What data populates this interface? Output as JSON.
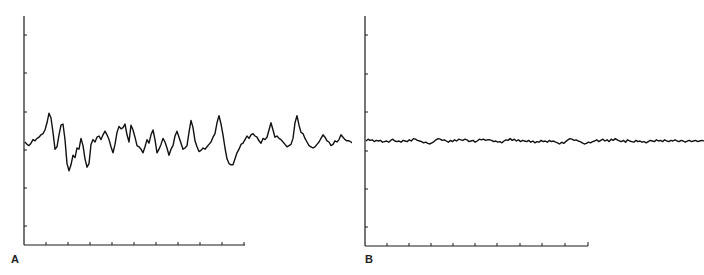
{
  "chart_data": [
    {
      "type": "line",
      "panel_label": "A",
      "title": "",
      "xlabel": "",
      "ylabel": "",
      "grid": false,
      "x_ticks": 10,
      "y_ticks": 6,
      "description": "Large-amplitude irregular fluctuating trace",
      "x": [
        0,
        2,
        4,
        6,
        8,
        10,
        12,
        14,
        16,
        18,
        20,
        22,
        24,
        26,
        28,
        30,
        32,
        34,
        36,
        38,
        40,
        42,
        44,
        46,
        48,
        50,
        52,
        54,
        56,
        58,
        60,
        62,
        64,
        66,
        68,
        70,
        72,
        74,
        76,
        78,
        80,
        82,
        84,
        86,
        88,
        90,
        92,
        94,
        96,
        98,
        100,
        102,
        104,
        106,
        108,
        110,
        112,
        114,
        116,
        118,
        120,
        122,
        124,
        126,
        128,
        130,
        132,
        134,
        136,
        138,
        140,
        142,
        144,
        146,
        148,
        150,
        152,
        154,
        156,
        158,
        160,
        162,
        164,
        166,
        168,
        170,
        172,
        174,
        176,
        178,
        180,
        182,
        184,
        186,
        188,
        190,
        192,
        194,
        196,
        198,
        200,
        202,
        204,
        206,
        208,
        210,
        212,
        214,
        216,
        218,
        220,
        222,
        224,
        226,
        228,
        230,
        232,
        234,
        236,
        238,
        240,
        242,
        244,
        246,
        248,
        250,
        252,
        254,
        256,
        258,
        260,
        262,
        264,
        266,
        268,
        270,
        272,
        274,
        276,
        278,
        280,
        282,
        284,
        286,
        288,
        290,
        292,
        294,
        296,
        298,
        300,
        302,
        304,
        306,
        308,
        310,
        312,
        314,
        316,
        318,
        320,
        322,
        324,
        326,
        328
      ],
      "values": [
        0.0,
        -0.2,
        -0.3,
        -0.1,
        0.2,
        0.1,
        0.3,
        0.4,
        0.6,
        0.7,
        1.0,
        1.6,
        2.4,
        2.0,
        0.8,
        -0.6,
        -0.4,
        0.6,
        1.4,
        1.5,
        0.2,
        -1.8,
        -2.4,
        -1.9,
        -1.1,
        -1.3,
        -0.5,
        -0.6,
        0.3,
        -0.3,
        -1.4,
        -2.1,
        -1.8,
        -0.2,
        0.2,
        0.0,
        0.4,
        0.5,
        0.2,
        0.6,
        0.9,
        0.6,
        0.2,
        -0.4,
        -0.9,
        -0.2,
        0.8,
        1.3,
        1.1,
        1.2,
        1.5,
        0.6,
        0.0,
        1.4,
        1.0,
        0.4,
        -0.3,
        -0.4,
        -0.6,
        -0.9,
        -0.4,
        0.2,
        -0.1,
        0.6,
        1.0,
        0.2,
        -0.9,
        -0.6,
        -0.2,
        0.3,
        0.0,
        -0.5,
        -1.1,
        -0.6,
        -0.3,
        0.5,
        0.9,
        0.4,
        -0.1,
        -0.6,
        -0.5,
        -0.3,
        0.8,
        1.8,
        1.2,
        0.1,
        -0.4,
        -0.8,
        -0.7,
        -0.5,
        -0.6,
        -0.4,
        -0.2,
        0.0,
        0.4,
        0.7,
        1.6,
        2.2,
        1.5,
        0.6,
        -0.5,
        -1.4,
        -1.8,
        -1.9,
        -1.9,
        -1.4,
        -0.9,
        -0.6,
        -0.2,
        -0.1,
        0.2,
        0.5,
        0.3,
        0.6,
        0.7,
        0.5,
        0.4,
        0.1,
        -0.1,
        0.3,
        0.2,
        0.4,
        1.0,
        1.6,
        1.0,
        0.4,
        0.5,
        0.3,
        0.2,
        0.0,
        -0.2,
        -0.4,
        -0.3,
        -0.2,
        0.3,
        1.6,
        2.2,
        1.4,
        0.8,
        0.7,
        0.3,
        0.0,
        -0.3,
        -0.4,
        -0.5,
        -0.4,
        -0.2,
        0.0,
        0.3,
        0.6,
        0.4,
        0.1,
        0.0,
        -0.3,
        -0.2,
        0.1,
        0.0,
        0.2,
        0.6,
        0.4,
        0.2,
        0.1,
        0.1,
        0.0,
        -0.1,
        0.1,
        0.0,
        0.0,
        0.0
      ]
    },
    {
      "type": "line",
      "panel_label": "B",
      "title": "",
      "xlabel": "",
      "ylabel": "",
      "grid": false,
      "x_ticks": 10,
      "y_ticks": 6,
      "description": "Low-amplitude flat noisy trace",
      "x": [
        0,
        2,
        4,
        6,
        8,
        10,
        12,
        14,
        16,
        18,
        20,
        22,
        24,
        26,
        28,
        30,
        32,
        34,
        36,
        38,
        40,
        42,
        44,
        46,
        48,
        50,
        52,
        54,
        56,
        58,
        60,
        62,
        64,
        66,
        68,
        70,
        72,
        74,
        76,
        78,
        80,
        82,
        84,
        86,
        88,
        90,
        92,
        94,
        96,
        98,
        100,
        102,
        104,
        106,
        108,
        110,
        112,
        114,
        116,
        118,
        120,
        122,
        124,
        126,
        128,
        130,
        132,
        134,
        136,
        138,
        140,
        142,
        144,
        146,
        148,
        150,
        152,
        154,
        156,
        158,
        160,
        162,
        164,
        166,
        168,
        170,
        172,
        174,
        176,
        178,
        180,
        182,
        184,
        186,
        188,
        190,
        192,
        194,
        196,
        198,
        200,
        202,
        204,
        206,
        208,
        210,
        212,
        214,
        216,
        218,
        220,
        222,
        224,
        226,
        228,
        230,
        232,
        234,
        236,
        238,
        240,
        242,
        244,
        246,
        248,
        250,
        252,
        254,
        256,
        258,
        260,
        262,
        264,
        266,
        268,
        270,
        272,
        274,
        276,
        278,
        280,
        282,
        284,
        286,
        288,
        290,
        292,
        294,
        296,
        298,
        300,
        302,
        304,
        306,
        308,
        310,
        312,
        314,
        316,
        318,
        320,
        322,
        324,
        326,
        328
      ],
      "values": [
        0.0,
        0.3,
        0.1,
        0.2,
        -0.1,
        0.1,
        0.0,
        0.1,
        -0.2,
        -0.1,
        0.0,
        -0.2,
        0.1,
        0.3,
        0.0,
        -0.1,
        0.0,
        -0.2,
        0.1,
        0.0,
        -0.1,
        0.2,
        0.0,
        0.4,
        0.3,
        0.1,
        0.0,
        -0.1,
        -0.3,
        -0.2,
        -0.4,
        -0.5,
        -0.3,
        -0.1,
        0.2,
        0.4,
        0.3,
        0.1,
        0.2,
        0.0,
        -0.2,
        0.1,
        -0.1,
        0.2,
        0.0,
        0.3,
        0.2,
        0.1,
        0.3,
        0.2,
        -0.1,
        0.0,
        0.1,
        -0.2,
        0.0,
        0.3,
        0.2,
        0.3,
        0.1,
        0.2,
        0.2,
        0.1,
        -0.1,
        0.0,
        -0.2,
        -0.1,
        -0.3,
        0.0,
        0.2,
        0.1,
        0.4,
        0.1,
        0.3,
        0.0,
        0.2,
        -0.1,
        0.1,
        0.0,
        -0.1,
        0.1,
        -0.2,
        0.0,
        -0.3,
        -0.1,
        -0.2,
        0.1,
        -0.1,
        0.0,
        -0.2,
        0.1,
        -0.1,
        0.0,
        -0.2,
        -0.3,
        -0.5,
        -0.2,
        -0.4,
        -0.1,
        0.2,
        0.4,
        0.3,
        0.1,
        0.2,
        0.0,
        -0.1,
        -0.3,
        -0.5,
        -0.4,
        -0.2,
        -0.3,
        -0.1,
        0.0,
        0.2,
        -0.1,
        0.1,
        0.3,
        0.0,
        0.2,
        -0.1,
        0.3,
        0.1,
        0.4,
        0.2,
        0.0,
        -0.1,
        0.1,
        -0.2,
        0.2,
        0.0,
        -0.1,
        -0.2,
        0.1,
        -0.1,
        0.0,
        -0.2,
        -0.1,
        -0.3,
        -0.1,
        0.1,
        0.0,
        -0.1,
        0.2,
        0.0,
        0.1,
        -0.1,
        0.2,
        0.0,
        -0.1,
        0.1,
        0.0,
        0.2,
        0.0,
        -0.1,
        0.1,
        0.0,
        -0.2,
        0.0,
        0.1,
        -0.1,
        0.0,
        0.1,
        -0.1,
        0.0,
        0.1,
        0.0,
        0.1
      ]
    }
  ],
  "panels": {
    "a": {
      "label": "A"
    },
    "b": {
      "label": "B"
    }
  }
}
